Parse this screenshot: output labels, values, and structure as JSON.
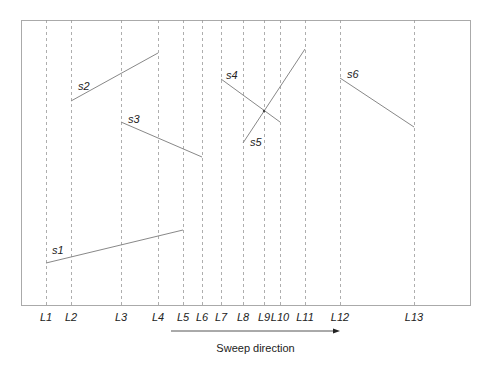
{
  "diagram": {
    "frame": {
      "left": 21,
      "top": 20,
      "right": 470,
      "bottom": 305,
      "color": "#aaaaaa"
    },
    "sweep_lines": [
      {
        "label": "L1",
        "x": 46
      },
      {
        "label": "L2",
        "x": 71
      },
      {
        "label": "L3",
        "x": 121
      },
      {
        "label": "L4",
        "x": 158
      },
      {
        "label": "L5",
        "x": 183
      },
      {
        "label": "L6",
        "x": 202
      },
      {
        "label": "L7",
        "x": 221
      },
      {
        "label": "L8",
        "x": 243
      },
      {
        "label": "L9",
        "x": 264
      },
      {
        "label": "L10",
        "x": 280
      },
      {
        "label": "L11",
        "x": 305
      },
      {
        "label": "L12",
        "x": 340
      },
      {
        "label": "L13",
        "x": 414
      }
    ],
    "segments": [
      {
        "label": "s1",
        "x1": 46,
        "y1": 263,
        "x2": 183,
        "y2": 230,
        "lx": 52,
        "ly": 254
      },
      {
        "label": "s2",
        "x1": 71,
        "y1": 101,
        "x2": 158,
        "y2": 53,
        "lx": 78,
        "ly": 90
      },
      {
        "label": "s3",
        "x1": 121,
        "y1": 122,
        "x2": 202,
        "y2": 157,
        "lx": 128,
        "ly": 123
      },
      {
        "label": "s4",
        "x1": 221,
        "y1": 79,
        "x2": 280,
        "y2": 122,
        "lx": 226,
        "ly": 79
      },
      {
        "label": "s5",
        "x1": 243,
        "y1": 143,
        "x2": 305,
        "y2": 49,
        "lx": 250,
        "ly": 146
      },
      {
        "label": "s6",
        "x1": 340,
        "y1": 78,
        "x2": 414,
        "y2": 127,
        "lx": 347,
        "ly": 78
      }
    ],
    "intersection": {
      "x": 264,
      "y": 111
    },
    "sweep_arrow": {
      "x1": 171,
      "x2": 340,
      "y": 331,
      "caption": "Sweep direction"
    },
    "colors": {
      "segment": "#888888",
      "dashed": "#999999",
      "text": "#222222",
      "arrow": "#555555"
    }
  }
}
